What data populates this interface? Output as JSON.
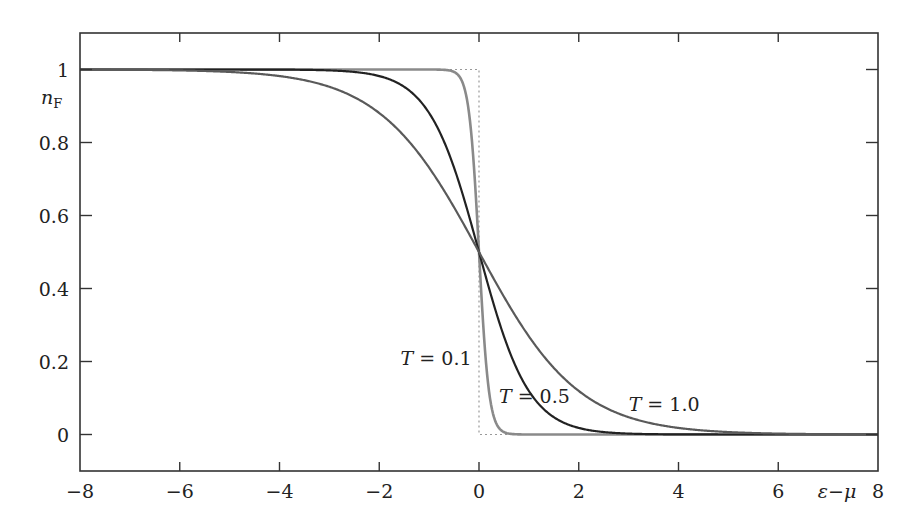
{
  "chart_data": {
    "type": "line",
    "title": "",
    "xlabel": "ε−μ",
    "ylabel": "n_F",
    "ylabel_main": "n",
    "ylabel_sub": "F",
    "xlim": [
      -8,
      8
    ],
    "ylim": [
      -0.1,
      1.1
    ],
    "grid": false,
    "legend": "inline labels",
    "x_ticks": [
      -8,
      -6,
      -4,
      -2,
      0,
      2,
      4,
      6,
      8
    ],
    "x_tick_labels": [
      "−8",
      "−6",
      "−4",
      "−2",
      "0",
      "2",
      "4",
      "6",
      "8"
    ],
    "y_ticks": [
      0,
      0.2,
      0.4,
      0.6,
      0.8,
      1
    ],
    "y_tick_labels": [
      "0",
      "0.2",
      "0.4",
      "0.6",
      "0.8",
      "1"
    ],
    "function": "n_F = 1 / (exp((ε−μ)/T) + 1)",
    "series": [
      {
        "name": "T = 0.1",
        "T": 0.1,
        "color": "#8a8a8a",
        "width": 2.6,
        "label": {
          "text_T": "T",
          "text_rest": " = 0.1",
          "x": -0.15,
          "y": 0.19,
          "anchor": "end"
        }
      },
      {
        "name": "T = 0.5",
        "T": 0.5,
        "color": "#222222",
        "width": 2.2,
        "label": {
          "text_T": "T",
          "text_rest": " = 0.5",
          "x": 0.4,
          "y": 0.085,
          "anchor": "start"
        }
      },
      {
        "name": "T = 1.0",
        "T": 1.0,
        "color": "#5a5a5a",
        "width": 2.2,
        "label": {
          "text_T": "T",
          "text_rest": " = 1.0",
          "x": 3.0,
          "y": 0.065,
          "anchor": "start"
        }
      }
    ],
    "reference_step": {
      "name": "T = 0 (step)",
      "style": "dotted",
      "color": "#999999"
    },
    "sample_values": {
      "x": [
        -8,
        -4,
        -2,
        -1,
        0,
        1,
        2,
        4,
        8
      ],
      "T=0.1": [
        1.0,
        1.0,
        1.0,
        1.0,
        0.5,
        0.0,
        0.0,
        0.0,
        0.0
      ],
      "T=0.5": [
        1.0,
        1.0,
        0.982,
        0.881,
        0.5,
        0.119,
        0.018,
        0.0,
        0.0
      ],
      "T=1.0": [
        1.0,
        0.982,
        0.881,
        0.731,
        0.5,
        0.269,
        0.119,
        0.018,
        0.0
      ]
    }
  }
}
